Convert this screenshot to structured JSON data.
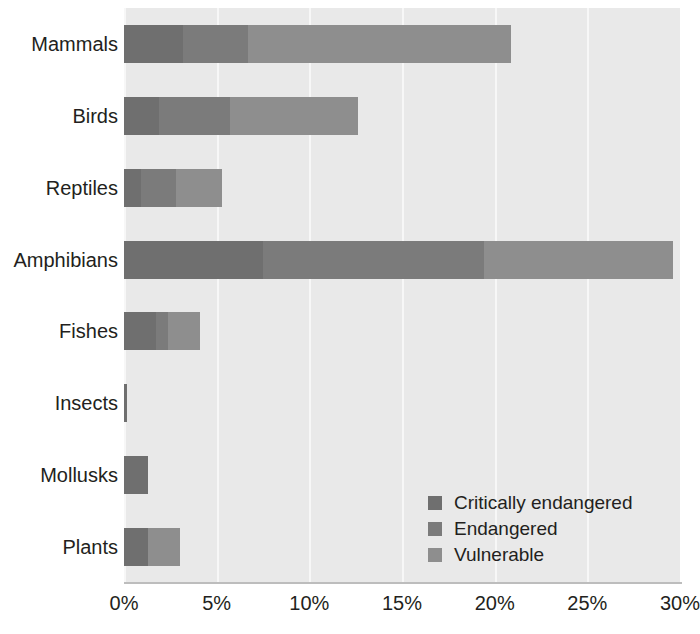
{
  "chart_data": {
    "type": "bar",
    "orientation": "horizontal",
    "stacked": true,
    "title": "",
    "xlabel": "",
    "ylabel": "",
    "xlim": [
      0,
      30
    ],
    "xticks": [
      "0%",
      "5%",
      "10%",
      "15%",
      "20%",
      "25%",
      "30%"
    ],
    "xtick_values": [
      0,
      5,
      10,
      15,
      20,
      25,
      30
    ],
    "grid": "vertical",
    "legend_position": "bottom-right-inside",
    "categories": [
      "Mammals",
      "Birds",
      "Reptiles",
      "Amphibians",
      "Fishes",
      "Insects",
      "Mollusks",
      "Plants"
    ],
    "series": [
      {
        "name": "Critically endangered",
        "color": "#6f6f6f",
        "values": [
          3.2,
          1.9,
          0.9,
          7.5,
          1.7,
          0.15,
          1.3,
          1.3
        ]
      },
      {
        "name": "Endangered",
        "color": "#7b7b7b",
        "values": [
          3.5,
          3.8,
          1.9,
          11.9,
          0.7,
          0.0,
          0.0,
          0.0
        ]
      },
      {
        "name": "Vulnerable",
        "color": "#8e8e8e",
        "values": [
          14.2,
          6.9,
          2.5,
          10.2,
          1.7,
          0.0,
          0.0,
          1.7
        ]
      }
    ],
    "totals": [
      20.9,
      12.6,
      5.3,
      29.6,
      4.1,
      0.15,
      1.3,
      3.0
    ]
  },
  "legend": {
    "items": [
      {
        "label": "Critically endangered",
        "color": "#6f6f6f"
      },
      {
        "label": "Endangered",
        "color": "#7b7b7b"
      },
      {
        "label": "Vulnerable",
        "color": "#8e8e8e"
      }
    ]
  },
  "colors": {
    "plot_background": "#e9e9e9",
    "gridline": "#f7f7f7",
    "axis_line": "#bdbdbd",
    "text": "#231f20",
    "page_background": "#ffffff"
  }
}
